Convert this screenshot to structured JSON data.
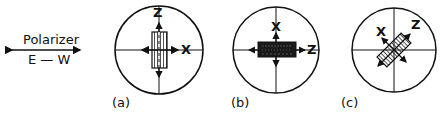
{
  "polarizer": {
    "label": "Polarizer",
    "direction": "E — W"
  },
  "panels": [
    {
      "caption": "(a)",
      "axis_vertical": "Z",
      "axis_horizontal": "X",
      "crystal": "striped-vertical"
    },
    {
      "caption": "(b)",
      "axis_vertical": "X",
      "axis_horizontal": "Z",
      "crystal": "dark-horizontal"
    },
    {
      "caption": "(c)",
      "axis_diag_left": "X",
      "axis_diag_right": "Z",
      "crystal": "striped-diagonal"
    }
  ],
  "colors": {
    "ink": "#111111",
    "background": "#ffffff"
  }
}
